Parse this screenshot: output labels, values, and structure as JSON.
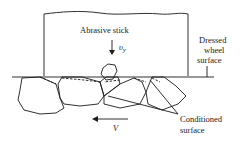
{
  "diagram": {
    "labels": {
      "stick": "Abrasive stick",
      "feed_velocity_symbol": "υ",
      "feed_velocity_subscript": "y",
      "dressed_line1": "Dressed",
      "dressed_line2": "wheel",
      "dressed_line3": "surface",
      "conditioned_line1": "Conditioned",
      "conditioned_line2": "surface",
      "wheel_velocity": "V"
    }
  }
}
